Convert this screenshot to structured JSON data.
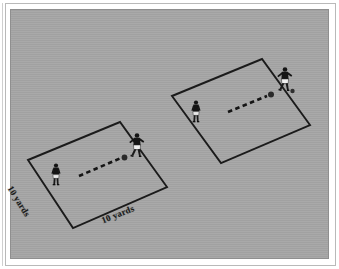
{
  "diagram": {
    "background_color": "#a6a6a6",
    "line_color": "#1b1b1b",
    "page_color": "#ffffff",
    "frame_color": "#b9b9b9"
  },
  "labels": {
    "lower_grid_left": "10 yards",
    "lower_grid_bottom": "10 yards"
  },
  "grids": [
    {
      "id": "lower-left-grid",
      "name": "lower-left-grid",
      "corners": [
        [
          28,
          160
        ],
        [
          120,
          122
        ],
        [
          167,
          187
        ],
        [
          73,
          228
        ]
      ],
      "width_label": "10 yards",
      "depth_label": "10 yards"
    },
    {
      "id": "upper-right-grid",
      "name": "upper-right-grid",
      "corners": [
        [
          172,
          96
        ],
        [
          262,
          59
        ],
        [
          310,
          125
        ],
        [
          221,
          163
        ]
      ],
      "width_label": "10 yards",
      "depth_label": "10 yards"
    }
  ],
  "players": [
    {
      "id": "lower-grid-passer",
      "grid": "lower-left-grid",
      "x": 56,
      "y": 178,
      "kit": "dark",
      "role": "receiver"
    },
    {
      "id": "lower-grid-server",
      "grid": "lower-left-grid",
      "x": 136,
      "y": 149,
      "kit": "dark-light",
      "role": "server"
    },
    {
      "id": "upper-grid-passer",
      "grid": "upper-right-grid",
      "x": 196,
      "y": 115,
      "kit": "dark",
      "role": "receiver"
    },
    {
      "id": "upper-grid-server",
      "grid": "upper-right-grid",
      "x": 285,
      "y": 83,
      "kit": "dark-light",
      "role": "server"
    }
  ],
  "balls": [
    {
      "id": "lower-grid-ball",
      "x": 124,
      "y": 158
    },
    {
      "id": "upper-grid-ball",
      "x": 271,
      "y": 95
    },
    {
      "id": "upper-grid-ball-2",
      "x": 293,
      "y": 91
    }
  ],
  "pass_lines": [
    {
      "id": "lower-grid-pass",
      "from": [
        79,
        175
      ],
      "to": [
        122,
        158
      ],
      "style": "dashed"
    },
    {
      "id": "upper-grid-pass",
      "from": [
        228,
        111
      ],
      "to": [
        268,
        96
      ],
      "style": "dashed"
    }
  ]
}
